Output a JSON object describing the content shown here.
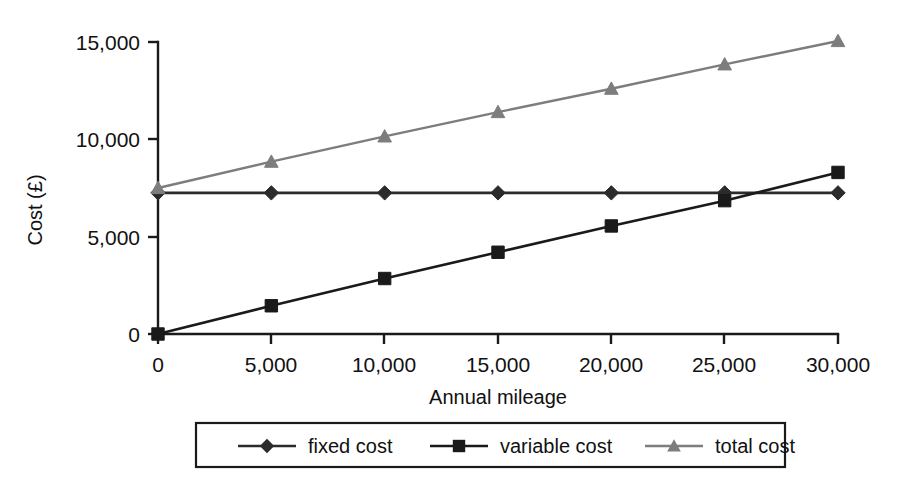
{
  "chart_data": {
    "type": "line",
    "title": "",
    "xlabel": "Annual mileage",
    "ylabel": "Cost (£)",
    "xlim": [
      0,
      30000
    ],
    "ylim": [
      0,
      15000
    ],
    "grid": false,
    "legend_position": "bottom",
    "x": [
      0,
      5000,
      10000,
      15000,
      20000,
      25000,
      30000
    ],
    "xticklabels": [
      "0",
      "5,000",
      "10,000",
      "15,000",
      "20,000",
      "25,000",
      "30,000"
    ],
    "yticks": [
      0,
      5000,
      10000,
      15000
    ],
    "yticklabels": [
      "0",
      "5,000",
      "10,000",
      "15,000"
    ],
    "series": [
      {
        "name": "fixed cost",
        "marker": "diamond",
        "color": "#2b2b2b",
        "values": [
          7250,
          7250,
          7250,
          7250,
          7250,
          7250,
          7250
        ]
      },
      {
        "name": "variable cost",
        "marker": "square",
        "color": "#1a1a1a",
        "values": [
          0,
          1450,
          2850,
          4200,
          5550,
          6850,
          8300
        ]
      },
      {
        "name": "total cost",
        "marker": "triangle",
        "color": "#7d7d7d",
        "values": [
          7500,
          8850,
          10150,
          11400,
          12600,
          13850,
          15050
        ]
      }
    ]
  },
  "legend": {
    "items": [
      {
        "label": "fixed cost",
        "marker": "diamond-marker",
        "color": "#2b2b2b"
      },
      {
        "label": "variable cost",
        "marker": "square-marker",
        "color": "#1a1a1a"
      },
      {
        "label": "total cost",
        "marker": "triangle-marker",
        "color": "#7d7d7d"
      }
    ]
  },
  "axes": {
    "y_title": "Cost (£)",
    "x_title": "Annual mileage",
    "y_tick_0": "0",
    "y_tick_1": "5,000",
    "y_tick_2": "10,000",
    "y_tick_3": "15,000",
    "x_tick_0": "0",
    "x_tick_1": "5,000",
    "x_tick_2": "10,000",
    "x_tick_3": "15,000",
    "x_tick_4": "20,000",
    "x_tick_5": "25,000",
    "x_tick_6": "30,000"
  }
}
